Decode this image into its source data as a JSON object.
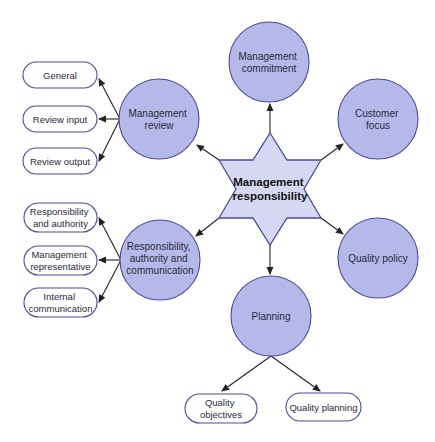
{
  "colors": {
    "star_fill": "#d6d8f3",
    "star_stroke": "#4b4b9b",
    "circle_fill": "#b5b9ea",
    "circle_stroke": "#4b4b9b",
    "pill_fill": "#ffffff",
    "pill_stroke": "#4b4b9b",
    "arrow": "#222222"
  },
  "center": {
    "lines": [
      "Management",
      "responsibility"
    ]
  },
  "circles": [
    {
      "id": "management-commitment",
      "lines": [
        "Management",
        "commitment"
      ]
    },
    {
      "id": "customer-focus",
      "lines": [
        "Customer",
        "focus"
      ]
    },
    {
      "id": "quality-policy",
      "lines": [
        "Quality policy"
      ]
    },
    {
      "id": "planning",
      "lines": [
        "Planning"
      ]
    },
    {
      "id": "responsibility-authority-communication",
      "lines": [
        "Responsibility,",
        "authority and",
        "communication"
      ]
    },
    {
      "id": "management-review",
      "lines": [
        "Management",
        "review"
      ]
    }
  ],
  "pills": {
    "management_review": [
      {
        "lines": [
          "General"
        ]
      },
      {
        "lines": [
          "Review input"
        ]
      },
      {
        "lines": [
          "Review output"
        ]
      }
    ],
    "responsibility": [
      {
        "lines": [
          "Responsibility",
          "and authority"
        ]
      },
      {
        "lines": [
          "Management",
          "representative"
        ]
      },
      {
        "lines": [
          "Internal",
          "communication"
        ]
      }
    ],
    "planning": [
      {
        "lines": [
          "Quality",
          "objectives"
        ]
      },
      {
        "lines": [
          "Quality planning"
        ]
      }
    ]
  }
}
